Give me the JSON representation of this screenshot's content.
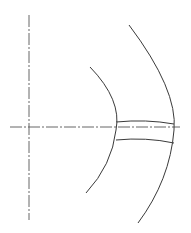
{
  "diagram": {
    "type": "technical-drawing",
    "colors": {
      "background": "#ffffff",
      "line": "#3a3a3a",
      "centerline": "#555555"
    },
    "centerlines": {
      "vertical": {
        "x": 29,
        "y1": 15,
        "y2": 220
      },
      "horizontal": {
        "y": 127,
        "x1": 10,
        "x2": 180
      }
    },
    "arcs": [
      {
        "name": "inner-arc",
        "path": "M 90 67 Q 122 100 116 130 Q 112 165 86 193"
      },
      {
        "name": "outer-arc",
        "path": "M 129 25 Q 178 90 174 130 Q 170 180 138 223"
      }
    ],
    "band": [
      {
        "name": "band-top-edge",
        "path": "M 116 122 Q 146 119 174 124"
      },
      {
        "name": "band-bottom-edge",
        "path": "M 116 140 Q 146 137 174 143"
      }
    ]
  }
}
